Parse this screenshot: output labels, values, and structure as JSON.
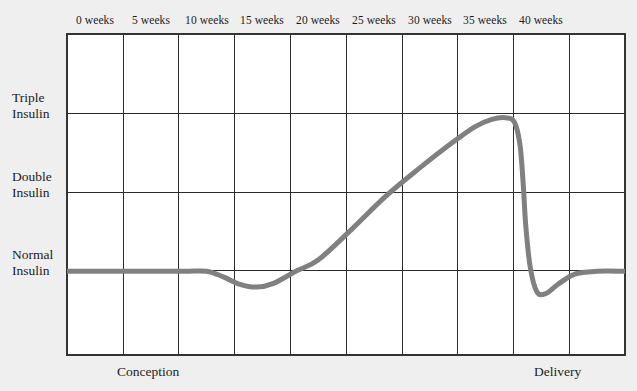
{
  "chart_data": {
    "type": "line",
    "title": "",
    "subtitle": "",
    "xlabel": "",
    "ylabel": "",
    "grid": true,
    "legend": null,
    "x_tick_labels": [
      "0 weeks",
      "5 weeks",
      "10 weeks",
      "15 weeks",
      "20 weeks",
      "25 weeks",
      "30 weeks",
      "35 weeks",
      "40 weeks"
    ],
    "x_tick_values": [
      0,
      5,
      10,
      15,
      20,
      25,
      30,
      35,
      40
    ],
    "xlim": [
      -2.5,
      47.5
    ],
    "y_tick_labels": [
      "Normal Insulin",
      "Double Insulin",
      "Triple Insulin"
    ],
    "y_tick_values": [
      1,
      2,
      3
    ],
    "ylim": [
      0.1,
      3.55
    ],
    "axis_captions": {
      "left": "Conception",
      "right": "Delivery"
    },
    "series": [
      {
        "name": "Insulin requirement",
        "color": "#808080",
        "line_width": 5,
        "x": [
          -2.5,
          0,
          4,
          8,
          10,
          11.5,
          13,
          14.5,
          16,
          18,
          20,
          23,
          26,
          29,
          32,
          34,
          35.5,
          36.8,
          37.6,
          38.1,
          38.4,
          38.6,
          39.0,
          39.6,
          40.4,
          41.5,
          43,
          45,
          47.5
        ],
        "values": [
          1.0,
          1.0,
          1.0,
          1.0,
          1.0,
          0.94,
          0.86,
          0.83,
          0.87,
          1.0,
          1.12,
          1.45,
          1.8,
          2.1,
          2.38,
          2.55,
          2.63,
          2.65,
          2.6,
          2.35,
          1.9,
          1.5,
          1.05,
          0.78,
          0.76,
          0.86,
          0.97,
          1.0,
          1.0
        ]
      }
    ],
    "annotations": {
      "description": "Insulin requirement during pregnancy: flat at normal until about 10 weeks, a dip reaching a minimum near 14 weeks, a steady rise peaking between 35 and 37 weeks near double-to-triple insulin, then a sharp fall at delivery with a brief undershoot below normal before returning to normal."
    }
  },
  "colors": {
    "background": "#efefef",
    "plot_area": "#ffffff",
    "border": "#333333",
    "gridline": "#2b2b2b",
    "curve": "#808080",
    "text": "#1c1c1c"
  }
}
